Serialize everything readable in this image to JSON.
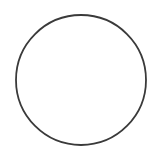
{
  "canvas": {
    "width": 149,
    "height": 161,
    "background": "#ffffff"
  },
  "shapes": [
    {
      "type": "circle",
      "cx": 81,
      "cy": 80,
      "r": 65,
      "fill": "#ffffff",
      "stroke": "#3a3a3a",
      "stroke_width": 1.8
    }
  ]
}
